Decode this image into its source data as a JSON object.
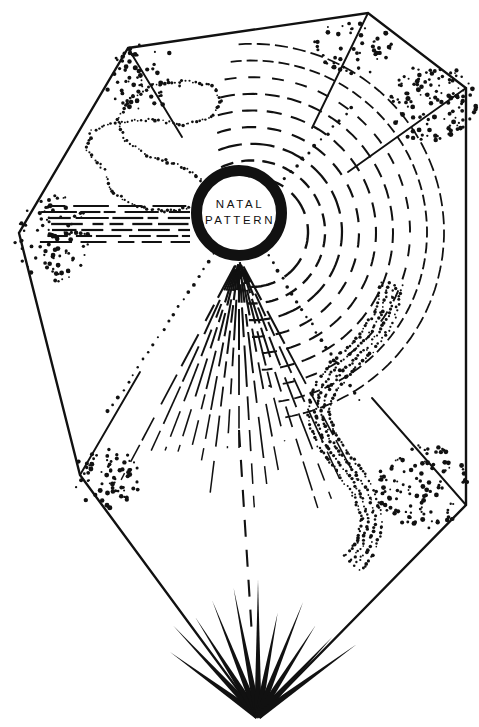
{
  "image": {
    "width": 479,
    "height": 727,
    "background_color": "#ffffff",
    "ink_color": "#111111",
    "style": "black-and-white line drawing, stippled dots, dashed rays"
  },
  "center_emblem": {
    "name": "natal-pattern-ring",
    "cx": 239,
    "cy": 213,
    "outer_radius": 48,
    "ring_thickness": 11,
    "fill_color": "#ffffff",
    "stroke_color": "#111111",
    "line_1": "NATAL",
    "line_2": "PATTERN"
  },
  "envelope": {
    "name": "aura-envelope-polygon",
    "stroke_color": "#111111",
    "stroke_width": 2.4,
    "vertices": [
      {
        "label": "top-left-shoulder",
        "x": 128,
        "y": 48
      },
      {
        "label": "top-right-shoulder",
        "x": 368,
        "y": 13
      },
      {
        "label": "right",
        "x": 466,
        "y": 88
      },
      {
        "label": "bottom-right",
        "x": 466,
        "y": 505
      },
      {
        "label": "bottom-apex",
        "x": 258,
        "y": 717
      },
      {
        "label": "bottom-left",
        "x": 80,
        "y": 475
      },
      {
        "label": "left",
        "x": 19,
        "y": 233
      }
    ]
  },
  "vertex_spurs": [
    {
      "name": "spur-top-left",
      "x1": 128,
      "y1": 48,
      "x2": 182,
      "y2": 137
    },
    {
      "name": "spur-top-right",
      "x1": 368,
      "y1": 13,
      "x2": 312,
      "y2": 128
    },
    {
      "name": "spur-right",
      "x1": 466,
      "y1": 88,
      "x2": 348,
      "y2": 172
    },
    {
      "name": "spur-bottom-right",
      "x1": 466,
      "y1": 505,
      "x2": 372,
      "y2": 398
    },
    {
      "name": "spur-bottom-left",
      "x1": 80,
      "y1": 475,
      "x2": 140,
      "y2": 372
    }
  ],
  "stipple_clusters": [
    {
      "name": "stipple-top-left-vertex",
      "cx": 143,
      "cy": 78,
      "rx": 40,
      "ry": 34,
      "count": 62,
      "seed": 11
    },
    {
      "name": "stipple-top-right-vertex",
      "cx": 352,
      "cy": 48,
      "rx": 40,
      "ry": 28,
      "count": 52,
      "seed": 23
    },
    {
      "name": "stipple-right-vertex",
      "cx": 432,
      "cy": 103,
      "rx": 46,
      "ry": 40,
      "count": 120,
      "seed": 37
    },
    {
      "name": "stipple-left-vertex",
      "cx": 52,
      "cy": 238,
      "rx": 38,
      "ry": 44,
      "count": 95,
      "seed": 53
    },
    {
      "name": "stipple-bottom-left-vertex",
      "cx": 107,
      "cy": 478,
      "rx": 34,
      "ry": 30,
      "count": 70,
      "seed": 71
    },
    {
      "name": "stipple-bottom-right-vertex",
      "cx": 423,
      "cy": 487,
      "rx": 46,
      "ry": 42,
      "count": 115,
      "seed": 89
    }
  ],
  "dashed_band_left": {
    "name": "horizontal-dashed-band",
    "description": "flat dashed streams flowing from left vertex into the ring",
    "rows": 7,
    "x_start": 38,
    "x_end": 190,
    "y_center": 224,
    "row_spacing": 6
  },
  "dashed_spray_down": {
    "name": "downward-dashed-spray",
    "description": "fan of dashed rays falling from the bottom of the ring",
    "origin_x": 239,
    "origin_y": 258,
    "ray_count": 17,
    "angle_start_deg": 62,
    "angle_end_deg": 118,
    "length_min": 120,
    "length_max": 270
  },
  "dashed_arcs_right": {
    "name": "spiral-dashed-arcs",
    "description": "concentric dashed arcs spiralling clockwise from the upper-right of the ring",
    "cx": 252,
    "cy": 232,
    "arc_count": 9,
    "radius_start": 56,
    "radius_step": 17,
    "angle_start_deg": -118,
    "angle_end_deg": 96
  },
  "dotted_curves": [
    {
      "name": "dotted-serpentine-upper-left",
      "description": "dotted looping S-curve in the upper-left quadrant",
      "points": [
        [
          104,
          170
        ],
        [
          86,
          150
        ],
        [
          92,
          131
        ],
        [
          118,
          122
        ],
        [
          152,
          120
        ],
        [
          186,
          125
        ],
        [
          212,
          117
        ],
        [
          222,
          100
        ],
        [
          213,
          86
        ],
        [
          186,
          81
        ],
        [
          152,
          86
        ],
        [
          128,
          100
        ],
        [
          118,
          120
        ],
        [
          124,
          140
        ],
        [
          148,
          155
        ],
        [
          178,
          165
        ],
        [
          200,
          178
        ],
        [
          204,
          196
        ],
        [
          190,
          208
        ],
        [
          164,
          212
        ],
        [
          134,
          206
        ],
        [
          112,
          192
        ],
        [
          104,
          174
        ]
      ]
    },
    {
      "name": "dotted-ribbon-lower-right",
      "description": "braided dotted S-ribbon in the lower-right quadrant",
      "strands": 4,
      "points": [
        [
          392,
          284
        ],
        [
          384,
          318
        ],
        [
          366,
          344
        ],
        [
          344,
          364
        ],
        [
          326,
          386
        ],
        [
          318,
          412
        ],
        [
          326,
          440
        ],
        [
          346,
          466
        ],
        [
          364,
          492
        ],
        [
          372,
          520
        ],
        [
          366,
          548
        ],
        [
          350,
          566
        ]
      ]
    }
  ],
  "dotted_rays": [
    {
      "name": "dotted-ray-to-bottom-left",
      "x1": 214,
      "y1": 254,
      "x2": 108,
      "y2": 412
    },
    {
      "name": "dotted-ray-to-bottom-right",
      "x1": 268,
      "y1": 256,
      "x2": 360,
      "y2": 400
    },
    {
      "name": "dotted-ray-to-top-right",
      "x1": 284,
      "y1": 178,
      "x2": 352,
      "y2": 108
    }
  ],
  "bottom_fan": {
    "name": "bottom-convergence-fan",
    "description": "tapered solid lines converging at the lower apex",
    "apex_x": 258,
    "apex_y": 716,
    "ray_count": 11,
    "angle_start_deg": 216,
    "angle_end_deg": 324,
    "length_min": 82,
    "length_max": 140
  },
  "center_dashed_tail": {
    "name": "central-dashed-tail",
    "x1": 239,
    "y1": 430,
    "x2": 252,
    "y2": 636
  }
}
